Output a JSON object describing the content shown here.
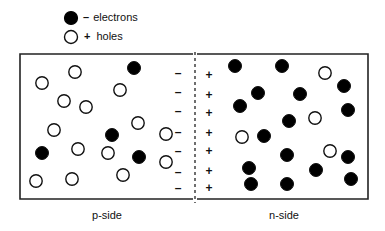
{
  "legend": {
    "electrons": {
      "sign": "–",
      "label": "electrons",
      "symbol": "filled-circle"
    },
    "holes": {
      "sign": "+",
      "label": "holes",
      "symbol": "open-circle"
    }
  },
  "labels": {
    "p_side": "p-side",
    "n_side": "n-side"
  },
  "colors": {
    "stroke": "#111111",
    "fill_electron": "#000000",
    "fill_hole": "#ffffff",
    "background": "#ffffff"
  },
  "p_side": {
    "holes": [
      [
        42,
        83
      ],
      [
        75,
        72
      ],
      [
        64,
        101
      ],
      [
        86,
        107
      ],
      [
        54,
        130
      ],
      [
        78,
        149
      ],
      [
        108,
        153
      ],
      [
        36,
        181
      ],
      [
        72,
        179
      ],
      [
        123,
        175
      ],
      [
        120,
        90
      ],
      [
        138,
        123
      ],
      [
        166,
        134
      ],
      [
        166,
        162
      ]
    ],
    "electrons": [
      [
        134,
        68
      ],
      [
        112,
        135
      ],
      [
        42,
        153
      ],
      [
        139,
        157
      ]
    ],
    "depletion_signs": {
      "sign": "–",
      "x": 178,
      "y": [
        73,
        92,
        111,
        132,
        151,
        172,
        188
      ]
    }
  },
  "n_side": {
    "electrons": [
      [
        235,
        66
      ],
      [
        282,
        66
      ],
      [
        344,
        86
      ],
      [
        258,
        93
      ],
      [
        300,
        94
      ],
      [
        240,
        106
      ],
      [
        348,
        110
      ],
      [
        289,
        121
      ],
      [
        264,
        136
      ],
      [
        287,
        155
      ],
      [
        348,
        157
      ],
      [
        249,
        168
      ],
      [
        316,
        170
      ],
      [
        251,
        184
      ],
      [
        287,
        184
      ],
      [
        351,
        179
      ]
    ],
    "holes": [
      [
        325,
        73
      ],
      [
        315,
        118
      ],
      [
        242,
        137
      ],
      [
        330,
        151
      ]
    ],
    "depletion_signs": {
      "sign": "+",
      "x": 209,
      "y": [
        75,
        95,
        113,
        133,
        151,
        171,
        188
      ]
    }
  }
}
